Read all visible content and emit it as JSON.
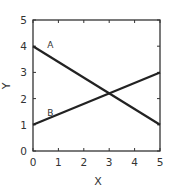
{
  "chart_data": {
    "type": "line",
    "title": "",
    "xlabel": "X",
    "ylabel": "Y",
    "xlim": [
      0,
      5
    ],
    "ylim": [
      0,
      5
    ],
    "xticks": [
      "0",
      "1",
      "2",
      "3",
      "4",
      "5"
    ],
    "yticks": [
      "0",
      "1",
      "2",
      "3",
      "4",
      "5"
    ],
    "grid": false,
    "legend": "none (inline line labels)",
    "series": [
      {
        "name": "A",
        "x": [
          0,
          5
        ],
        "y": [
          4,
          1
        ]
      },
      {
        "name": "B",
        "x": [
          0,
          5
        ],
        "y": [
          1,
          3
        ]
      }
    ],
    "annotations": [
      {
        "text": "A",
        "x": 0.6,
        "y": 4.1
      },
      {
        "text": "B",
        "x": 0.6,
        "y": 1.5
      }
    ],
    "intersection": {
      "x": 3.0,
      "y": 2.2
    }
  }
}
